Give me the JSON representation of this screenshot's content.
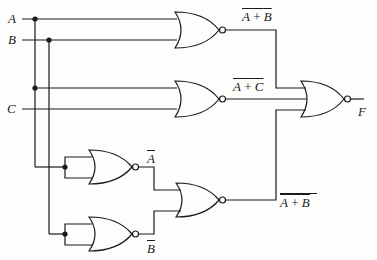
{
  "diagram": {
    "type": "logic-circuit",
    "inputs": [
      {
        "id": "A",
        "label": "A"
      },
      {
        "id": "B",
        "label": "B"
      },
      {
        "id": "C",
        "label": "C"
      }
    ],
    "output": {
      "id": "F",
      "label": "F"
    },
    "gates": [
      {
        "id": "g1",
        "type": "NOR",
        "inputs": [
          "A",
          "B"
        ],
        "output_label": "A + B",
        "output_overbar": true
      },
      {
        "id": "g2",
        "type": "NOR",
        "inputs": [
          "A",
          "C"
        ],
        "output_label": "A + C",
        "output_overbar": true
      },
      {
        "id": "g_na",
        "type": "NOR",
        "inputs": [
          "A",
          "A"
        ],
        "output_label": "A",
        "output_overbar": true
      },
      {
        "id": "g_nb",
        "type": "NOR",
        "inputs": [
          "B",
          "B"
        ],
        "output_label": "B",
        "output_overbar": true
      },
      {
        "id": "g3",
        "type": "NOR",
        "inputs": [
          "g_na",
          "g_nb"
        ],
        "output_label": "A + B",
        "output_overbar": true,
        "operands_overbar": true
      },
      {
        "id": "g4",
        "type": "NOR",
        "inputs": [
          "g1",
          "g2",
          "g3"
        ],
        "output_label": "F"
      }
    ],
    "colors": {
      "line": "#1a1a1a",
      "background": "#fdfdfc"
    }
  },
  "labels": {
    "a": "A",
    "b": "B",
    "c": "C",
    "f": "F",
    "g1_out_a": "A",
    "g1_out_plus": " + ",
    "g1_out_b": "B",
    "g2_out_a": "A",
    "g2_out_plus": " + ",
    "g2_out_c": "C",
    "na_out": "A",
    "nb_out": "B",
    "g3_out_a": "A",
    "g3_out_plus": " + ",
    "g3_out_b": "B"
  }
}
